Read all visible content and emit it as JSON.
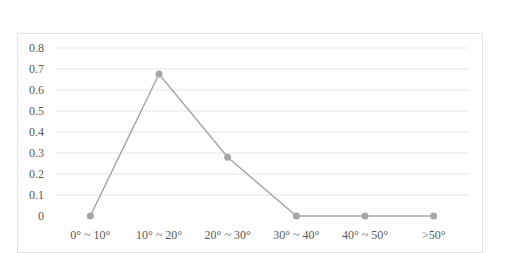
{
  "chart_data": {
    "type": "line",
    "title": "",
    "xlabel": "",
    "ylabel": "",
    "categories": [
      "0° ~ 10°",
      "10° ~ 20°",
      "20° ~ 30°",
      "30° ~ 40°",
      "40° ~ 50°",
      ">50°"
    ],
    "series": [
      {
        "name": "Series 1",
        "values": [
          0,
          0.676,
          0.28,
          0,
          0,
          0
        ],
        "color": "#a6a6a6"
      }
    ],
    "ylim": [
      0,
      0.8
    ],
    "yticks": [
      "0",
      "0.1",
      "0.2",
      "0.3",
      "0.4",
      "0.5",
      "0.6",
      "0.7",
      "0.8"
    ],
    "grid": true,
    "legend": "none"
  }
}
